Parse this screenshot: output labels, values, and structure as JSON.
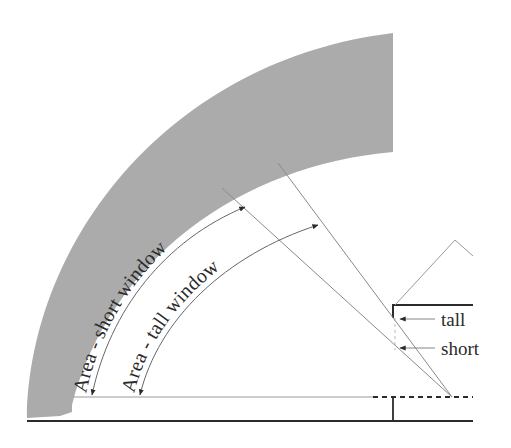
{
  "diagram": {
    "type": "window daylight area schematic",
    "labels": {
      "area_short": "Area - short window",
      "area_tall": "Area - tall window",
      "tall": "tall",
      "short": "short"
    },
    "colors": {
      "band_fill": "#ababab",
      "line": "#8a8a8a",
      "thick_line": "#2b2b2b",
      "text": "#2a2a2a",
      "background": "#ffffff"
    }
  }
}
